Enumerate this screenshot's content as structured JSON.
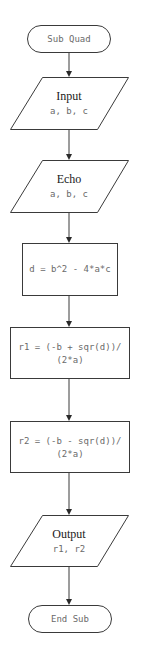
{
  "flowchart": {
    "start": {
      "label": "Sub Quad"
    },
    "input": {
      "title": "Input",
      "vars": "a, b, c"
    },
    "echo": {
      "title": "Echo",
      "vars": "a, b, c"
    },
    "calc_d": {
      "line1": "d = b^2 - 4*a*c"
    },
    "calc_r1": {
      "line1": "r1 = (-b + sqr(d))/",
      "line2": "(2*a)"
    },
    "calc_r2": {
      "line1": "r2 = (-b - sqr(d))/",
      "line2": "(2*a)"
    },
    "output": {
      "title": "Output",
      "vars": "r1, r2"
    },
    "end": {
      "label": "End Sub"
    }
  },
  "colors": {
    "stroke": "#3a3a3a",
    "label_text": "#6a6a6a",
    "title_text": "#1a1a1a",
    "background": "#ffffff"
  }
}
